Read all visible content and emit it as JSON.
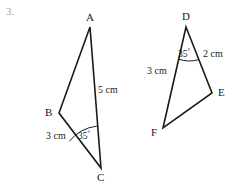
{
  "figure": {
    "item_number": "3.",
    "background_color": "#ffffff",
    "stroke_color": "#1a1a1a",
    "text_color": "#1a1a1a",
    "item_number_color": "#a8a8a8",
    "triangles": [
      {
        "name": "triangle-abc",
        "vertices": [
          {
            "id": "A",
            "label": "A",
            "x": 90,
            "y": 27,
            "label_x": 86,
            "label_y": 12
          },
          {
            "id": "B",
            "label": "B",
            "x": 59,
            "y": 113,
            "label_x": 45,
            "label_y": 107
          },
          {
            "id": "C",
            "label": "C",
            "x": 101,
            "y": 168,
            "label_x": 97,
            "label_y": 172
          }
        ],
        "edges": [
          {
            "from": "A",
            "to": "B"
          },
          {
            "from": "B",
            "to": "C"
          },
          {
            "from": "C",
            "to": "A"
          }
        ],
        "side_labels": [
          {
            "name": "side-ca-length",
            "text": "5 cm",
            "x": 98,
            "y": 85
          },
          {
            "name": "side-bc-length",
            "text": "3 cm",
            "x": 46,
            "y": 131
          }
        ],
        "angle_marks": [
          {
            "name": "angle-c",
            "at_vertex": "C",
            "value": "35",
            "unit": "°",
            "label_x": 78,
            "label_y": 130,
            "arc_radius": 42
          }
        ]
      },
      {
        "name": "triangle-def",
        "vertices": [
          {
            "id": "D",
            "label": "D",
            "x": 186,
            "y": 27,
            "label_x": 182,
            "label_y": 11
          },
          {
            "id": "E",
            "label": "E",
            "x": 212,
            "y": 93,
            "label_x": 218,
            "label_y": 87
          },
          {
            "id": "F",
            "label": "F",
            "x": 163,
            "y": 128,
            "label_x": 151,
            "label_y": 127
          }
        ],
        "edges": [
          {
            "from": "D",
            "to": "E"
          },
          {
            "from": "E",
            "to": "F"
          },
          {
            "from": "F",
            "to": "D"
          }
        ],
        "side_labels": [
          {
            "name": "side-de-length",
            "text": "2 cm",
            "x": 203,
            "y": 49
          },
          {
            "name": "side-df-length",
            "text": "3 cm",
            "x": 147,
            "y": 66
          }
        ],
        "angle_marks": [
          {
            "name": "angle-d",
            "at_vertex": "D",
            "value": "35",
            "unit": "°",
            "label_x": 178,
            "label_y": 48,
            "arc_radius": 33
          }
        ]
      }
    ]
  }
}
